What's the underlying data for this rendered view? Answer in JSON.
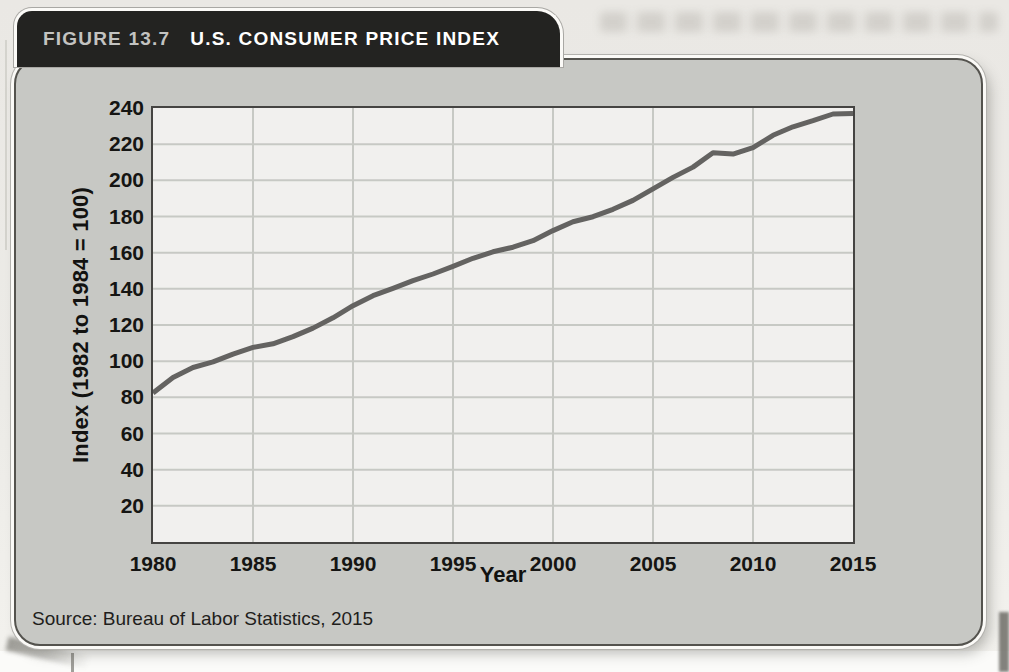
{
  "figure": {
    "tab": {
      "label": "FIGURE 13.7",
      "title": "U.S. CONSUMER PRICE INDEX"
    },
    "source": "Source: Bureau of Labor Statistics, 2015"
  },
  "chart_data": {
    "type": "line",
    "title": "U.S. Consumer Price Index",
    "xlabel": "Year",
    "ylabel": "Index (1982 to 1984 = 100)",
    "x": [
      1980,
      1981,
      1982,
      1983,
      1984,
      1985,
      1986,
      1987,
      1988,
      1989,
      1990,
      1991,
      1992,
      1993,
      1994,
      1995,
      1996,
      1997,
      1998,
      1999,
      2000,
      2001,
      2002,
      2003,
      2004,
      2005,
      2006,
      2007,
      2008,
      2009,
      2010,
      2011,
      2012,
      2013,
      2014,
      2015
    ],
    "values": [
      82.4,
      90.9,
      96.5,
      99.6,
      103.9,
      107.6,
      109.6,
      113.6,
      118.3,
      124.0,
      130.7,
      136.2,
      140.3,
      144.5,
      148.2,
      152.4,
      156.9,
      160.5,
      163.0,
      166.6,
      172.2,
      177.1,
      179.9,
      184.0,
      188.9,
      195.3,
      201.6,
      207.3,
      215.3,
      214.5,
      218.1,
      224.9,
      229.6,
      233.0,
      236.7,
      237.0
    ],
    "xticks": [
      1980,
      1985,
      1990,
      1995,
      2000,
      2005,
      2010,
      2015
    ],
    "yticks": [
      20,
      40,
      60,
      80,
      100,
      120,
      140,
      160,
      180,
      200,
      220,
      240
    ],
    "xlim": [
      1980,
      2015
    ],
    "ylim": [
      0,
      240
    ],
    "grid": true,
    "legend": "none",
    "line_color": "#646361",
    "grid_color": "#c7c9c4",
    "plot_bg": "#f1f0ee",
    "plot_border": "#454442",
    "panel_bg": "#c7c8c4",
    "tab_bg": "#232321"
  }
}
